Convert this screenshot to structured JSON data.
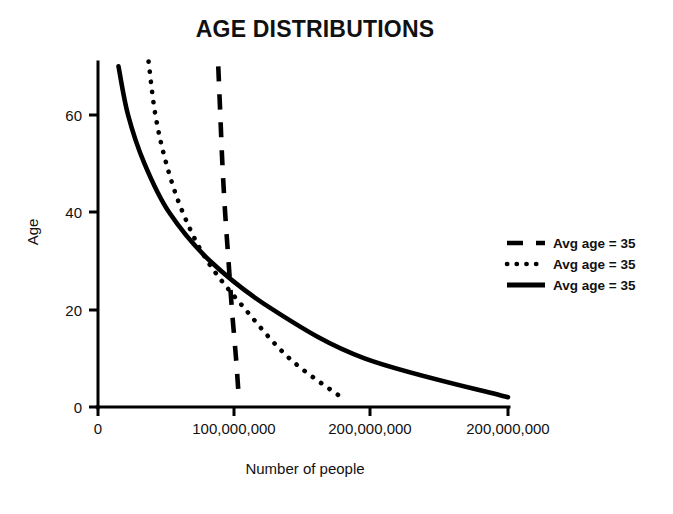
{
  "chart_data": {
    "type": "line",
    "title": "AGE DISTRIBUTIONS",
    "xlabel": "Number of people",
    "ylabel": "Age",
    "grid": false,
    "legend_position": "right",
    "xlim": [
      0,
      300000000
    ],
    "ylim": [
      0,
      72
    ],
    "xticks": [
      0,
      100000000,
      200000000,
      300000000
    ],
    "xtick_labels": [
      "0",
      "100,000,000",
      "200,000,000",
      "200,000,000"
    ],
    "yticks": [
      0,
      20,
      40,
      60
    ],
    "ytick_labels": [
      "0",
      "20",
      "40",
      "60"
    ],
    "series": [
      {
        "name": "Avg age = 35",
        "style": "dashed",
        "points": [
          [
            88000000,
            70
          ],
          [
            89500000,
            60
          ],
          [
            91000000,
            50
          ],
          [
            93000000,
            40
          ],
          [
            95500000,
            30
          ],
          [
            98000000,
            20
          ],
          [
            101000000,
            10
          ],
          [
            103000000,
            2
          ]
        ]
      },
      {
        "name": "Avg age = 35",
        "style": "dotted",
        "points": [
          [
            37000000,
            71
          ],
          [
            42000000,
            60
          ],
          [
            50000000,
            50
          ],
          [
            62000000,
            40
          ],
          [
            80000000,
            30
          ],
          [
            108000000,
            20
          ],
          [
            140000000,
            10
          ],
          [
            178000000,
            2
          ]
        ]
      },
      {
        "name": "Avg age = 35",
        "style": "solid",
        "points": [
          [
            15000000,
            70
          ],
          [
            22000000,
            60
          ],
          [
            34000000,
            50
          ],
          [
            52000000,
            40
          ],
          [
            82000000,
            30
          ],
          [
            128000000,
            20
          ],
          [
            195000000,
            10
          ],
          [
            300000000,
            2
          ]
        ]
      }
    ],
    "legend_entries": [
      {
        "label": "Avg age = 35",
        "style": "dashed"
      },
      {
        "label": "Avg age = 35",
        "style": "dotted"
      },
      {
        "label": "Avg age = 35",
        "style": "solid"
      }
    ]
  }
}
